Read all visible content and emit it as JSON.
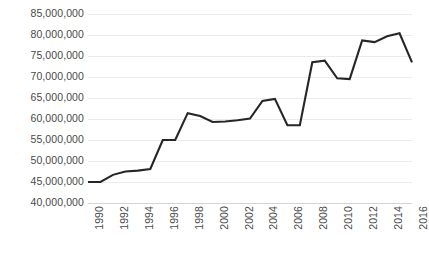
{
  "chart_data": {
    "type": "line",
    "title": "",
    "subtitle": "",
    "xlabel": "",
    "ylabel": "",
    "grid": true,
    "legend": false,
    "legend_position": "none",
    "line_color": "#262626",
    "gridline_color": "#ebebeb",
    "axis_color": "#d4d4d4",
    "label_color": "#4a4a4a",
    "ylim": [
      40000000,
      85000000
    ],
    "ytick_step": 5000000,
    "ytick_labels": [
      "85,000,000",
      "80,000,000",
      "75,000,000",
      "70,000,000",
      "65,000,000",
      "60,000,000",
      "55,000,000",
      "50,000,000",
      "45,000,000",
      "40,000,000"
    ],
    "ytick_values": [
      85000000,
      80000000,
      75000000,
      70000000,
      65000000,
      60000000,
      55000000,
      50000000,
      45000000,
      40000000
    ],
    "xlim": [
      1990,
      2016
    ],
    "xtick_step": 2,
    "xtick_labels": [
      "1990",
      "1992",
      "1994",
      "1996",
      "1998",
      "2000",
      "2002",
      "2004",
      "2006",
      "2008",
      "2010",
      "2012",
      "2014",
      "2016"
    ],
    "categories": [
      1990,
      1991,
      1992,
      1993,
      1994,
      1995,
      1996,
      1997,
      1998,
      1999,
      2000,
      2001,
      2002,
      2003,
      2004,
      2005,
      2006,
      2007,
      2008,
      2009,
      2010,
      2011,
      2012,
      2013,
      2014,
      2015,
      2016
    ],
    "values": [
      45000000,
      45000000,
      46700000,
      47500000,
      47700000,
      48100000,
      55000000,
      55000000,
      61400000,
      60700000,
      59300000,
      59400000,
      59700000,
      60100000,
      64300000,
      64800000,
      58500000,
      58500000,
      73500000,
      73900000,
      69700000,
      69500000,
      78700000,
      78300000,
      79700000,
      80400000,
      73500000
    ],
    "series": [
      {
        "name": "series-1",
        "values": [
          45000000,
          45000000,
          46700000,
          47500000,
          47700000,
          48100000,
          55000000,
          55000000,
          61400000,
          60700000,
          59300000,
          59400000,
          59700000,
          60100000,
          64300000,
          64800000,
          58500000,
          58500000,
          73500000,
          73900000,
          69700000,
          69500000,
          78700000,
          78300000,
          79700000,
          80400000,
          73500000
        ]
      }
    ]
  }
}
